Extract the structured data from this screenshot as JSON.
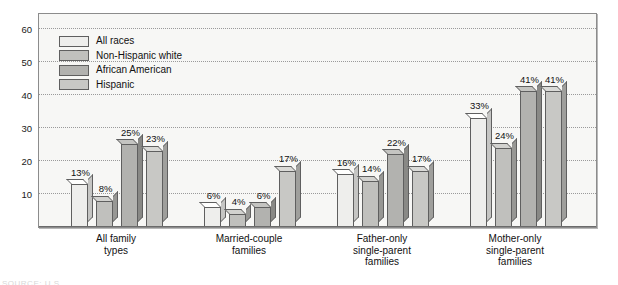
{
  "chart_data": {
    "type": "bar",
    "title": "",
    "subtitle": "",
    "xlabel": "",
    "ylabel": "",
    "ylim": [
      0,
      65
    ],
    "yticks": [
      10,
      20,
      30,
      40,
      50,
      60
    ],
    "ytick_labels": [
      "10",
      "20",
      "30",
      "40",
      "50",
      "60"
    ],
    "grid": true,
    "legend_position": "upper-left-inside",
    "value_label_suffix": "%",
    "categories": [
      "All family types",
      "Married-couple families",
      "Father-only single-parent families",
      "Mother-only single-parent families"
    ],
    "category_lines": [
      [
        "All family",
        "types"
      ],
      [
        "Married-couple",
        "families"
      ],
      [
        "Father-only",
        "single-parent",
        "families"
      ],
      [
        "Mother-only",
        "single-parent",
        "families"
      ]
    ],
    "series": [
      {
        "name": "All races",
        "color": "#eeeeec",
        "values": [
          13,
          6,
          16,
          33
        ],
        "labels": [
          "13%",
          "6%",
          "16%",
          "33%"
        ]
      },
      {
        "name": "Non-Hispanic white",
        "color": "#c0c0bd",
        "values": [
          8,
          4,
          14,
          24
        ],
        "labels": [
          "8%",
          "4%",
          "14%",
          "24%"
        ]
      },
      {
        "name": "African American",
        "color": "#b2b2af",
        "values": [
          25,
          6,
          22,
          41
        ],
        "labels": [
          "25%",
          "6%",
          "22%",
          "41%"
        ]
      },
      {
        "name": "Hispanic",
        "color": "#c8c8c5",
        "values": [
          23,
          17,
          17,
          41
        ],
        "labels": [
          "23%",
          "17%",
          "17%",
          "41%"
        ]
      }
    ]
  },
  "legend": {
    "items": [
      {
        "label": "All races",
        "color": "#eeeeec"
      },
      {
        "label": "Non-Hispanic white",
        "color": "#c0c0bd"
      },
      {
        "label": "African American",
        "color": "#b2b2af"
      },
      {
        "label": "Hispanic",
        "color": "#c8c8c5"
      }
    ]
  },
  "footer": {
    "fragment": "SOURCE: U.S."
  }
}
